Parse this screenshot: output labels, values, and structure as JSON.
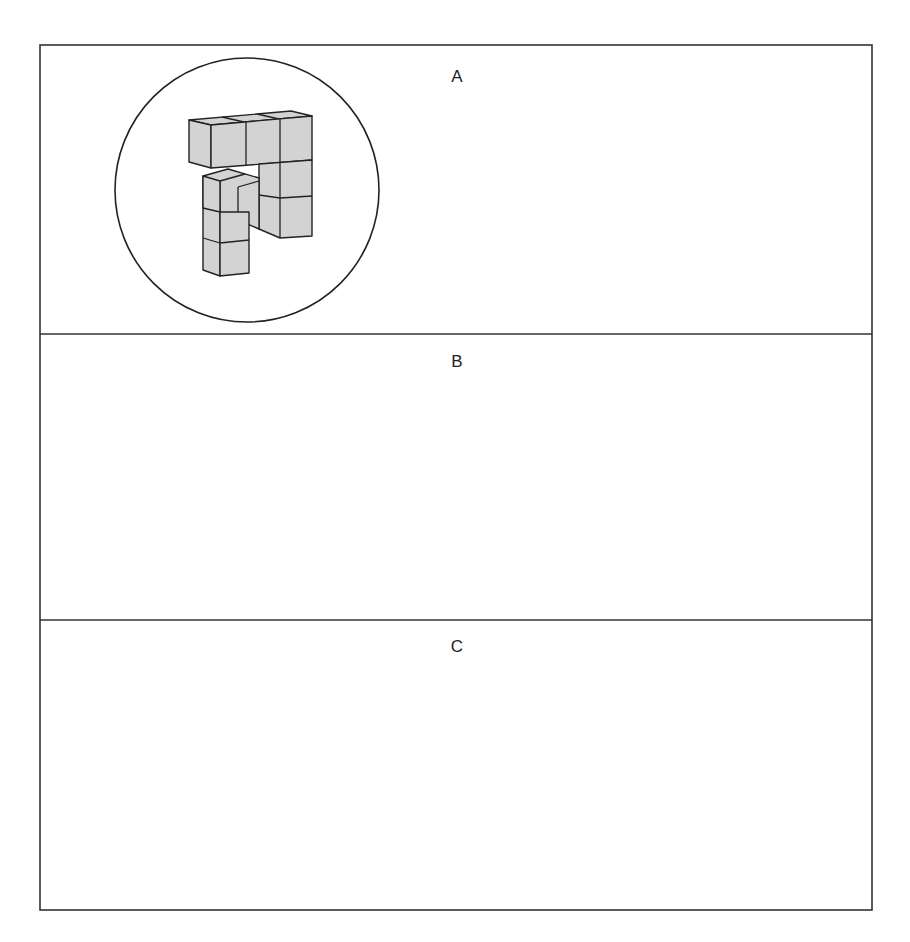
{
  "figure": {
    "colors": {
      "frame": "#333333",
      "cube_fill": "#d3d3d3",
      "cube_edge": "#222222",
      "background": "#ffffff"
    },
    "panels": [
      {
        "label": "A",
        "left_object": "3D cube assembly (view 1)",
        "right_object": "3D cube assembly (view 2)"
      },
      {
        "label": "B",
        "left_object": "3D cube assembly (view 1)",
        "right_object": "3D cube assembly (view 2)"
      },
      {
        "label": "C",
        "left_object": "3D cube assembly (view 1)",
        "right_object": "3D cube assembly (view 2)"
      }
    ]
  }
}
